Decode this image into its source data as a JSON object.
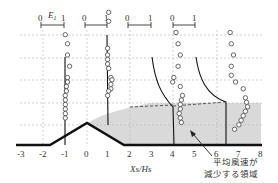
{
  "chart_data": {
    "type": "scatter",
    "title": "",
    "xlabel": "Xs/Hs",
    "ylabel": "",
    "xlim": [
      -3,
      8
    ],
    "x_ticks": [
      "-3",
      "-2",
      "-1",
      "0",
      "1",
      "2",
      "3",
      "4",
      "5",
      "6",
      "7",
      "8"
    ],
    "grid": true,
    "scale_bar_label": "E1",
    "scale_bar_ticks": [
      "0",
      "1"
    ],
    "profile_stations": [
      -1,
      1,
      4,
      6.5
    ],
    "annotation": {
      "line1": "平均風速が",
      "line2": "減少する領域"
    },
    "terrain": {
      "shape": "triangular hill",
      "x": [
        -3,
        -1.7,
        0,
        1.7,
        8
      ],
      "height": [
        0,
        0,
        1,
        0,
        0
      ]
    },
    "series": [
      {
        "name": "measured E1 (circles)",
        "station": -1,
        "points_E1_vs_height": [
          [
            0.0,
            4.9
          ],
          [
            0.1,
            4.5
          ],
          [
            0.1,
            4.0
          ],
          [
            0.2,
            3.5
          ],
          [
            0.1,
            3.0
          ],
          [
            0.1,
            2.8
          ],
          [
            0.05,
            2.6
          ],
          [
            0.05,
            2.4
          ],
          [
            0.0,
            2.2
          ],
          [
            0.0,
            2.0
          ],
          [
            0.0,
            1.8
          ],
          [
            0.0,
            1.6
          ],
          [
            0.0,
            1.4
          ],
          [
            0.0,
            1.2
          ]
        ]
      },
      {
        "name": "measured E1 (circles)",
        "station": 1,
        "points_E1_vs_height": [
          [
            0.0,
            5.9
          ],
          [
            0.0,
            5.5
          ],
          [
            -0.05,
            4.3
          ],
          [
            -0.05,
            4.0
          ],
          [
            -0.05,
            3.8
          ],
          [
            -0.05,
            3.6
          ],
          [
            0.0,
            3.4
          ],
          [
            0.1,
            3.0
          ],
          [
            0.15,
            2.9
          ],
          [
            0.1,
            2.7
          ],
          [
            0.1,
            2.5
          ],
          [
            0.0,
            2.4
          ],
          [
            -0.05,
            2.2
          ]
        ]
      },
      {
        "name": "measured E1 (circles)",
        "station": 4,
        "points_E1_vs_height": [
          [
            0.1,
            5.0
          ],
          [
            0.2,
            4.5
          ],
          [
            0.3,
            4.0
          ],
          [
            0.2,
            3.5
          ],
          [
            0.0,
            3.0
          ],
          [
            -0.05,
            2.8
          ],
          [
            0.3,
            2.6
          ],
          [
            0.4,
            2.2
          ],
          [
            0.35,
            2.0
          ],
          [
            0.3,
            1.8
          ],
          [
            0.3,
            1.6
          ],
          [
            0.25,
            1.4
          ],
          [
            0.3,
            1.2
          ],
          [
            0.35,
            1.0
          ]
        ]
      },
      {
        "name": "measured E1 (circles)",
        "station": 6.5,
        "points_E1_vs_height": [
          [
            0.1,
            5.0
          ],
          [
            0.15,
            4.5
          ],
          [
            0.25,
            4.0
          ],
          [
            0.15,
            3.5
          ],
          [
            0.15,
            3.1
          ],
          [
            0.35,
            2.8
          ],
          [
            0.7,
            2.5
          ],
          [
            0.8,
            2.1
          ],
          [
            0.85,
            1.9
          ],
          [
            0.9,
            1.7
          ],
          [
            0.8,
            1.5
          ],
          [
            0.7,
            1.3
          ],
          [
            0.6,
            1.1
          ],
          [
            0.5,
            0.9
          ],
          [
            0.3,
            0.7
          ]
        ]
      }
    ],
    "reduced_wind_region": {
      "description": "shaded grey region downstream of hill top",
      "x_range": [
        0,
        8
      ],
      "top_height": 1.8
    }
  }
}
